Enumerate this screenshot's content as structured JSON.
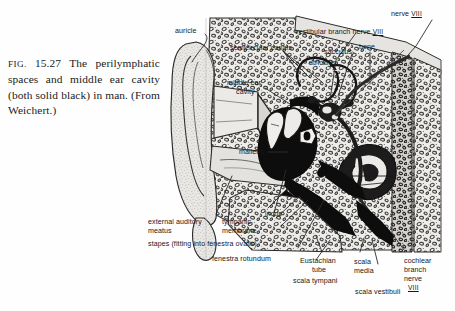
{
  "figure": {
    "caption": {
      "figno": "FIG.",
      "number": "15.27",
      "text": "The perilymphatic spaces and middle ear cavity (both solid black) in man. (From Weichert.)",
      "full": "FIG.  15.27  The perilymphatic spaces and middle ear cavity (both solid black) in man. (From Weichert.)"
    },
    "title_plain": "The perilymphatic spaces and middle ear cavity (both solid black) in man.",
    "source": "From Weichert.",
    "media": "halftone line engraving, grayscale"
  },
  "labels": {
    "auricle": "auricle",
    "semicircular_canals": "semicircular canals",
    "middle_ear_cavity_line1": "middle ear",
    "middle_ear_cavity_line2": "cavity",
    "vestibular_branch_nerve": "vestibular branch nerve",
    "vestibular_branch_nerve_numeral": "VIII",
    "nerve": "nerve",
    "nerve_numeral": "VIII",
    "sacculus": "sacculus-",
    "utriculus": "utriculus",
    "bone": "bone",
    "malleus": "malleus",
    "external_auditory_line1": "external auditory",
    "external_auditory_line2": "meatus",
    "tympanic_line1": "tympanic",
    "tympanic_line2": "membrane",
    "incus": "incus",
    "stapes": "stapes (fitting into fenestra ovalis)",
    "fenestra_rotundum": "fenestra rotundum",
    "eustachian_line1": "Eustachian",
    "eustachian_line2": "tube",
    "scala_tympani": "scala tympani",
    "scala_media_line1": "scala",
    "scala_media_line2": "media",
    "scala_vestibuli": "scala vestibuli",
    "cochlear_line1": "cochlear",
    "cochlear_line2": "branch",
    "cochlear_line3": "nerve",
    "cochlear_numeral": "VIII"
  },
  "colors": {
    "page_background": "#ffffff",
    "ink": "#17181a",
    "leader_line": "#2b2b2b",
    "solid_black_cavity": "#0d0d0d",
    "bone_light": "#e2e0dd",
    "bone_mid": "#c9c6c2",
    "tissue_gray": "#d8d5d1",
    "caption_text": "#1a1a1a"
  }
}
